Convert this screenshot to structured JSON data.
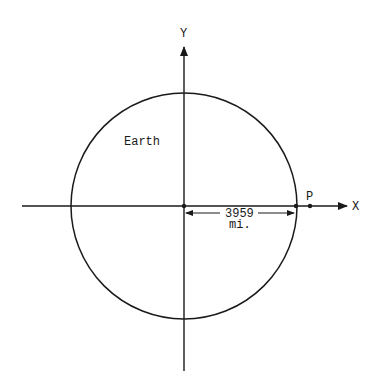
{
  "diagram": {
    "axes": {
      "x_label": "X",
      "y_label": "Y"
    },
    "circle_label": "Earth",
    "point_label": "P",
    "radius_value": "3959",
    "radius_unit": "mi.",
    "colors": {
      "line": "#1a1a1a",
      "background": "#ffffff"
    }
  }
}
